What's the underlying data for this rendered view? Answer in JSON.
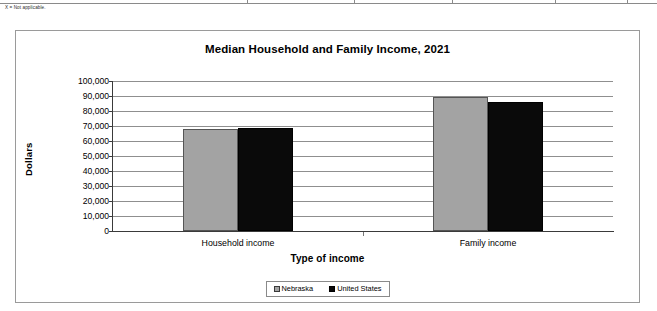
{
  "footnote": {
    "text": "X = Not applicable."
  },
  "table_remnant": {
    "column_tick_positions": [
      247,
      354,
      452,
      555,
      627
    ]
  },
  "chart_data": {
    "type": "bar",
    "title": "Median Household and Family Income, 2021",
    "xlabel": "Type of income",
    "ylabel": "Dollars",
    "categories": [
      "Household income",
      "Family income"
    ],
    "series": [
      {
        "name": "Nebraska",
        "color": "#a3a3a3",
        "values": [
          68000,
          89000
        ]
      },
      {
        "name": "United States",
        "color": "#0a0a0a",
        "values": [
          68500,
          86000
        ]
      }
    ],
    "ylim": [
      0,
      100000
    ],
    "ytick_step": 10000,
    "ytick_labels": [
      "100,000",
      "90,000",
      "80,000",
      "70,000",
      "60,000",
      "50,000",
      "40,000",
      "30,000",
      "20,000",
      "10,000",
      "0"
    ],
    "grid": true,
    "legend_position": "bottom"
  }
}
